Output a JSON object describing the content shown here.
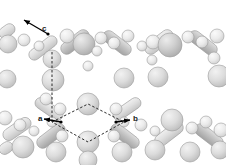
{
  "figure": {
    "type": "crystal-structure-packing-diagram",
    "background_color": "#ffffff",
    "render_style": "shaded-spheres-and-capsules",
    "palette": {
      "sphere_light": "#e8e8e8",
      "sphere_mid": "#d2d2d2",
      "sphere_dark": "#b8b8b8",
      "capsule_light": "#dcdcdc",
      "capsule_dark": "#b0b0b0",
      "outline": "#9a9a9a",
      "dash_line": "#2b2b2b",
      "arrow": "#000000",
      "label_text": "#1a1a1a"
    }
  },
  "axes": {
    "items": [
      {
        "label": "a",
        "x": 38,
        "y": 115,
        "arrow_from": [
          61,
          122
        ],
        "arrow_to": [
          44,
          119
        ]
      },
      {
        "label": "b",
        "x": 133,
        "y": 115,
        "arrow_from": [
          116,
          122
        ],
        "arrow_to": [
          130,
          120
        ]
      },
      {
        "label": "c",
        "x": 42,
        "y": 25,
        "arrow_from": [
          48,
          34
        ],
        "arrow_to": [
          24,
          20
        ]
      }
    ]
  },
  "unit_cell": {
    "shape": "rhombus",
    "style": "dashed",
    "vertices": [
      [
        52,
        122
      ],
      [
        88,
        104
      ],
      [
        124,
        122
      ],
      [
        88,
        142
      ]
    ],
    "vertical_axis_line": {
      "from": [
        52,
        52
      ],
      "to": [
        52,
        122
      ]
    }
  },
  "spheres": [
    {
      "cx": 8,
      "cy": 44,
      "r": 9,
      "tone": "mid"
    },
    {
      "cx": 24,
      "cy": 40,
      "r": 6,
      "tone": "light"
    },
    {
      "cx": 39,
      "cy": 46,
      "r": 5,
      "tone": "light"
    },
    {
      "cx": 52,
      "cy": 59,
      "r": 9,
      "tone": "mid"
    },
    {
      "cx": 53,
      "cy": 80,
      "r": 11,
      "tone": "mid"
    },
    {
      "cx": 46,
      "cy": 99,
      "r": 6,
      "tone": "light"
    },
    {
      "cx": 67,
      "cy": 36,
      "r": 7,
      "tone": "light"
    },
    {
      "cx": 84,
      "cy": 44,
      "r": 11,
      "tone": "dark"
    },
    {
      "cx": 101,
      "cy": 38,
      "r": 6,
      "tone": "light"
    },
    {
      "cx": 97,
      "cy": 51,
      "r": 5,
      "tone": "light"
    },
    {
      "cx": 114,
      "cy": 43,
      "r": 6,
      "tone": "light"
    },
    {
      "cx": 128,
      "cy": 36,
      "r": 6,
      "tone": "light"
    },
    {
      "cx": 142,
      "cy": 46,
      "r": 5,
      "tone": "light"
    },
    {
      "cx": 153,
      "cy": 42,
      "r": 7,
      "tone": "light"
    },
    {
      "cx": 170,
      "cy": 45,
      "r": 12,
      "tone": "dark"
    },
    {
      "cx": 188,
      "cy": 37,
      "r": 6,
      "tone": "light"
    },
    {
      "cx": 202,
      "cy": 42,
      "r": 6,
      "tone": "light"
    },
    {
      "cx": 217,
      "cy": 36,
      "r": 7,
      "tone": "light"
    },
    {
      "cx": 152,
      "cy": 60,
      "r": 5,
      "tone": "light"
    },
    {
      "cx": 158,
      "cy": 77,
      "r": 10,
      "tone": "mid"
    },
    {
      "cx": 124,
      "cy": 78,
      "r": 10,
      "tone": "mid"
    },
    {
      "cx": 88,
      "cy": 66,
      "r": 5,
      "tone": "light"
    },
    {
      "cx": 214,
      "cy": 58,
      "r": 6,
      "tone": "light"
    },
    {
      "cx": 219,
      "cy": 76,
      "r": 11,
      "tone": "mid"
    },
    {
      "cx": 7,
      "cy": 79,
      "r": 9,
      "tone": "mid"
    },
    {
      "cx": 88,
      "cy": 104,
      "r": 11,
      "tone": "mid"
    },
    {
      "cx": 60,
      "cy": 109,
      "r": 6,
      "tone": "light"
    },
    {
      "cx": 116,
      "cy": 109,
      "r": 6,
      "tone": "light"
    },
    {
      "cx": 52,
      "cy": 122,
      "r": 5,
      "tone": "light"
    },
    {
      "cx": 124,
      "cy": 122,
      "r": 5,
      "tone": "light"
    },
    {
      "cx": 88,
      "cy": 142,
      "r": 11,
      "tone": "mid"
    },
    {
      "cx": 62,
      "cy": 136,
      "r": 6,
      "tone": "light"
    },
    {
      "cx": 114,
      "cy": 136,
      "r": 6,
      "tone": "light"
    },
    {
      "cx": 20,
      "cy": 125,
      "r": 6,
      "tone": "light"
    },
    {
      "cx": 34,
      "cy": 131,
      "r": 5,
      "tone": "light"
    },
    {
      "cx": 5,
      "cy": 118,
      "r": 7,
      "tone": "light"
    },
    {
      "cx": 141,
      "cy": 125,
      "r": 6,
      "tone": "light"
    },
    {
      "cx": 155,
      "cy": 131,
      "r": 5,
      "tone": "light"
    },
    {
      "cx": 172,
      "cy": 120,
      "r": 11,
      "tone": "mid"
    },
    {
      "cx": 192,
      "cy": 128,
      "r": 6,
      "tone": "light"
    },
    {
      "cx": 206,
      "cy": 122,
      "r": 6,
      "tone": "light"
    },
    {
      "cx": 221,
      "cy": 130,
      "r": 7,
      "tone": "light"
    },
    {
      "cx": 23,
      "cy": 147,
      "r": 11,
      "tone": "mid"
    },
    {
      "cx": 56,
      "cy": 152,
      "r": 10,
      "tone": "mid"
    },
    {
      "cx": 122,
      "cy": 152,
      "r": 10,
      "tone": "mid"
    },
    {
      "cx": 155,
      "cy": 150,
      "r": 10,
      "tone": "mid"
    },
    {
      "cx": 190,
      "cy": 152,
      "r": 10,
      "tone": "mid"
    },
    {
      "cx": 220,
      "cy": 150,
      "r": 9,
      "tone": "mid"
    },
    {
      "cx": 88,
      "cy": 160,
      "r": 9,
      "tone": "mid"
    }
  ],
  "capsules": [
    {
      "x1": 30,
      "y1": 58,
      "x2": 56,
      "y2": 38,
      "w": 11,
      "tone": "light"
    },
    {
      "x1": 62,
      "y1": 52,
      "x2": 88,
      "y2": 32,
      "w": 12,
      "tone": "dark"
    },
    {
      "x1": 104,
      "y1": 33,
      "x2": 130,
      "y2": 53,
      "w": 12,
      "tone": "dark"
    },
    {
      "x1": 146,
      "y1": 52,
      "x2": 172,
      "y2": 32,
      "w": 12,
      "tone": "light"
    },
    {
      "x1": 190,
      "y1": 33,
      "x2": 216,
      "y2": 53,
      "w": 12,
      "tone": "dark"
    },
    {
      "x1": 0,
      "y1": 36,
      "x2": 14,
      "y2": 26,
      "w": 11,
      "tone": "light"
    },
    {
      "x1": 36,
      "y1": 100,
      "x2": 62,
      "y2": 118,
      "w": 11,
      "tone": "light"
    },
    {
      "x1": 114,
      "y1": 118,
      "x2": 140,
      "y2": 100,
      "w": 11,
      "tone": "light"
    },
    {
      "x1": 4,
      "y1": 138,
      "x2": 30,
      "y2": 120,
      "w": 12,
      "tone": "light"
    },
    {
      "x1": 38,
      "y1": 146,
      "x2": 64,
      "y2": 126,
      "w": 12,
      "tone": "dark"
    },
    {
      "x1": 112,
      "y1": 126,
      "x2": 138,
      "y2": 146,
      "w": 12,
      "tone": "dark"
    },
    {
      "x1": 156,
      "y1": 144,
      "x2": 182,
      "y2": 124,
      "w": 12,
      "tone": "light"
    },
    {
      "x1": 196,
      "y1": 126,
      "x2": 222,
      "y2": 146,
      "w": 12,
      "tone": "dark"
    },
    {
      "x1": 0,
      "y1": 152,
      "x2": 12,
      "y2": 144,
      "w": 11,
      "tone": "light"
    }
  ]
}
